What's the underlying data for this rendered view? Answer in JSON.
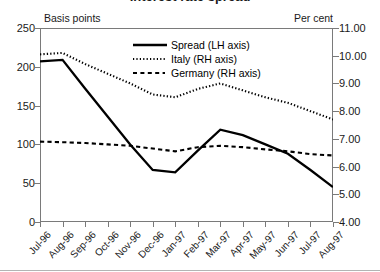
{
  "figure": {
    "title_partial": "Interest rate spread",
    "left_unit_label": "Basis points",
    "right_unit_label": "Per cent"
  },
  "legend": {
    "items": [
      {
        "label": "Spread (LH axis)",
        "style": "solid",
        "color": "#000000"
      },
      {
        "label": "Italy (RH axis)",
        "style": "dotted",
        "color": "#000000"
      },
      {
        "label": "Germany (RH axis)",
        "style": "dashed",
        "color": "#000000"
      }
    ]
  },
  "axes": {
    "left_ticks": [
      "250",
      "200",
      "150",
      "100",
      "50",
      "0"
    ],
    "right_ticks": [
      "11.00",
      "10.00",
      "9.00",
      "8.00",
      "7.00",
      "6.00",
      "5.00",
      "4.00"
    ],
    "x_ticks": [
      "Jul-96",
      "Aug-96",
      "Sep-96",
      "Oct-96",
      "Nov-96",
      "Dec-96",
      "Jan-97",
      "Feb-97",
      "Mar-97",
      "Apr-97",
      "May-97",
      "Jun-97",
      "Jul-97",
      "Aug-97"
    ]
  },
  "chart_data": {
    "type": "line",
    "title": "Interest rate spread",
    "xlabel": "",
    "ylabel": "Basis points",
    "y2label": "Per cent",
    "categories": [
      "Jul-96",
      "Aug-96",
      "Sep-96",
      "Oct-96",
      "Nov-96",
      "Dec-96",
      "Jan-97",
      "Feb-97",
      "Mar-97",
      "Apr-97",
      "May-97",
      "Jun-97",
      "Jul-97",
      "Aug-97"
    ],
    "ylim": [
      0,
      250
    ],
    "y2lim": [
      4.0,
      11.0
    ],
    "grid": false,
    "legend_position": "upper-center-inside",
    "series": [
      {
        "name": "Spread (LH axis)",
        "axis": "left",
        "unit": "basis points",
        "style": "solid",
        "values": [
          207,
          209,
          172,
          136,
          100,
          67,
          64,
          92,
          119,
          112,
          100,
          88,
          67,
          45
        ]
      },
      {
        "name": "Italy (RH axis)",
        "axis": "right",
        "unit": "per cent",
        "style": "dotted",
        "values": [
          10.05,
          10.1,
          9.7,
          9.35,
          9.0,
          8.6,
          8.5,
          8.8,
          9.0,
          8.75,
          8.5,
          8.3,
          8.0,
          7.7
        ]
      },
      {
        "name": "Germany (RH axis)",
        "axis": "right",
        "unit": "per cent",
        "style": "dashed",
        "values": [
          6.9,
          6.88,
          6.85,
          6.8,
          6.75,
          6.65,
          6.55,
          6.7,
          6.75,
          6.7,
          6.62,
          6.55,
          6.45,
          6.4
        ]
      }
    ]
  }
}
